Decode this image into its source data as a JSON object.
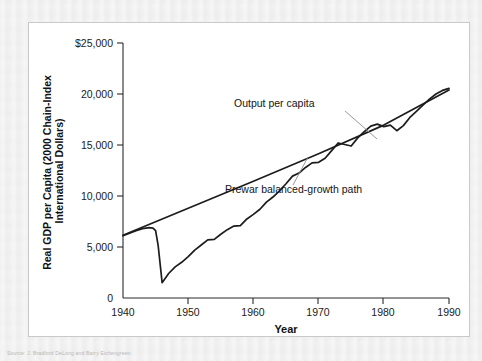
{
  "figure": {
    "source_note": "Source: J. Bradford DeLong and Barry Eichengreen.",
    "annotations": [
      {
        "id": "output-per-capita",
        "label": "Output per capita"
      },
      {
        "id": "prewar-path",
        "label": "Prewar balanced-growth path"
      }
    ]
  },
  "chart_data": {
    "type": "line",
    "title": "",
    "subtitle": "",
    "xlabel": "Year",
    "ylabel": "Real GDP per Capita (2000 Chain-Index International Dollars)",
    "xlim": [
      1940,
      1990
    ],
    "ylim": [
      0,
      25000
    ],
    "xticks": [
      1940,
      1950,
      1960,
      1970,
      1980,
      1990
    ],
    "xtick_labels": [
      "1940",
      "1950",
      "1960",
      "1970",
      "1980",
      "1990"
    ],
    "yticks": [
      0,
      5000,
      10000,
      15000,
      20000,
      25000
    ],
    "ytick_labels": [
      "0",
      "5,000",
      "10,000",
      "15,000",
      "20,000",
      "$25,000"
    ],
    "grid": false,
    "legend": "none",
    "annotations_on_plot": [
      {
        "text": "Output per capita",
        "x": 1966.5,
        "y": 17900
      },
      {
        "text": "Prewar balanced-growth path",
        "x": 1966.0,
        "y": 10750
      }
    ],
    "series": [
      {
        "name": "Output per capita",
        "x": [
          1940,
          1941,
          1942,
          1943,
          1944,
          1944.6,
          1945,
          1945.4,
          1946,
          1947,
          1948,
          1949,
          1950,
          1951,
          1952,
          1953,
          1954,
          1955,
          1956,
          1957,
          1958,
          1959,
          1960,
          1961,
          1962,
          1963,
          1964,
          1965,
          1966,
          1967,
          1968,
          1969,
          1970,
          1971,
          1972,
          1973,
          1974,
          1975,
          1976,
          1977,
          1978,
          1979,
          1980,
          1981,
          1982,
          1983,
          1984,
          1985,
          1986,
          1987,
          1988,
          1989,
          1990
        ],
        "y": [
          6100,
          6350,
          6600,
          6800,
          6900,
          6850,
          6600,
          5100,
          1500,
          2400,
          3050,
          3500,
          4050,
          4700,
          5200,
          5700,
          5750,
          6250,
          6700,
          7050,
          7100,
          7750,
          8200,
          8700,
          9400,
          9900,
          10500,
          11200,
          11950,
          12250,
          12800,
          13250,
          13300,
          13700,
          14450,
          15200,
          15050,
          14900,
          15700,
          16300,
          16850,
          17050,
          16800,
          16950,
          16400,
          16900,
          17700,
          18300,
          18900,
          19500,
          20000,
          20350,
          20550
        ]
      },
      {
        "name": "Prewar balanced-growth path",
        "x": [
          1940,
          1950,
          1960,
          1970,
          1980,
          1990
        ],
        "y": [
          6150,
          8800,
          11450,
          14150,
          16950,
          20400
        ]
      }
    ]
  }
}
